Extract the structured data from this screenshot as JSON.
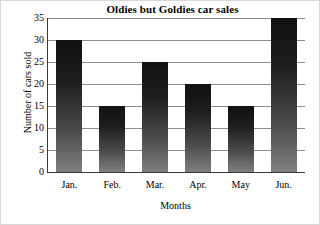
{
  "chart_data": {
    "type": "bar",
    "title": "Oldies but Goldies car sales",
    "xlabel": "Months",
    "ylabel": "Number of cars sold",
    "categories": [
      "Jan.",
      "Feb.",
      "Mar.",
      "Apr.",
      "May",
      "Jun."
    ],
    "values": [
      30,
      15,
      25,
      20,
      15,
      35
    ],
    "ylim": [
      0,
      35
    ],
    "yticks": [
      0,
      5,
      10,
      15,
      20,
      25,
      30,
      35
    ],
    "ytick_labels": [
      "0",
      "5",
      "10",
      "15",
      "20",
      "25",
      "30",
      "35"
    ],
    "grid": true,
    "legend": null,
    "series": [
      {
        "name": "Number of cars sold",
        "values": [
          30,
          15,
          25,
          20,
          15,
          35
        ]
      }
    ],
    "bar_color_top": "#111111",
    "bar_color_bottom": "#7f7f7f",
    "axis_color": "#3a3a3a",
    "grid_color": "#8e8e8e",
    "background": "#ffffff"
  }
}
